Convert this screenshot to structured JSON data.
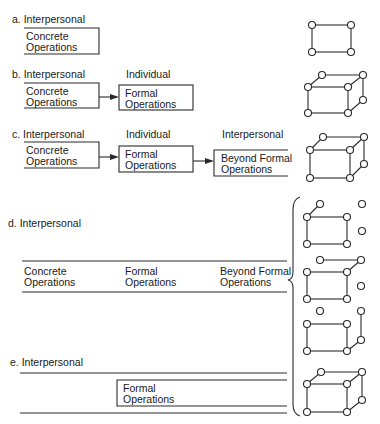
{
  "figure": {
    "title_cropped": "",
    "stroke_color": "#2a2a2a",
    "panels": [
      {
        "id": "a",
        "label": "a. Interpersonal",
        "columns": [],
        "boxes": [
          {
            "line1": "Concrete",
            "line2": "Operations"
          }
        ],
        "shape": "rectangle"
      },
      {
        "id": "b",
        "label": "b. Interpersonal",
        "columns": [
          "Individual"
        ],
        "boxes": [
          {
            "line1": "Concrete",
            "line2": "Operations"
          },
          {
            "line1": "Formal",
            "line2": "Operations"
          }
        ],
        "shape": "cube"
      },
      {
        "id": "c",
        "label": "c. Interpersonal",
        "columns": [
          "Individual",
          "Interpersonal"
        ],
        "boxes": [
          {
            "line1": "Concrete",
            "line2": "Operations"
          },
          {
            "line1": "Formal",
            "line2": "Operations"
          },
          {
            "line1": "Beyond Formal",
            "line2": "Operations"
          }
        ],
        "shape": "cube"
      },
      {
        "id": "d",
        "label": "d. Interpersonal",
        "columns": [],
        "boxes": [
          {
            "line1": "Concrete",
            "line2": "Operations"
          },
          {
            "line1": "Formal",
            "line2": "Operations"
          },
          {
            "line1": "Beyond Formal",
            "line2": "Operations"
          }
        ],
        "shape": "fragmented-cubes-with-brace"
      },
      {
        "id": "e",
        "label": "e. Interpersonal",
        "columns": [],
        "boxes": [
          {
            "line1": "Formal",
            "line2": "Operations"
          }
        ],
        "shape": "cube"
      }
    ]
  }
}
